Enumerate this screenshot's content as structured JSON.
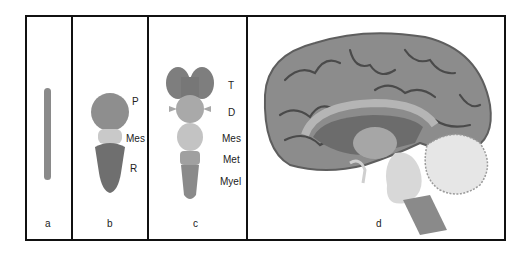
{
  "panels": [
    {
      "id": "a",
      "label": "a",
      "stage": "neural tube",
      "structure_labels": []
    },
    {
      "id": "b",
      "label": "b",
      "stage": "three-vesicle stage",
      "structure_labels": [
        "P",
        "Mes",
        "R"
      ]
    },
    {
      "id": "c",
      "label": "c",
      "stage": "five-vesicle stage",
      "structure_labels": [
        "T",
        "D",
        "Mes",
        "Met",
        "Myel"
      ]
    },
    {
      "id": "d",
      "label": "d",
      "stage": "adult brain (sagittal view)",
      "structure_labels": []
    }
  ],
  "colors": {
    "border": "#111111",
    "tube": "#8a8a8a",
    "prosencephalon": "#8e8e8e",
    "mesencephalon": "#c9c9c9",
    "rhombencephalon": "#6f6f6f",
    "cortex": "#8c8c8c",
    "sulci": "#4a4a4a",
    "cerebellum": "#d8d8d8"
  }
}
